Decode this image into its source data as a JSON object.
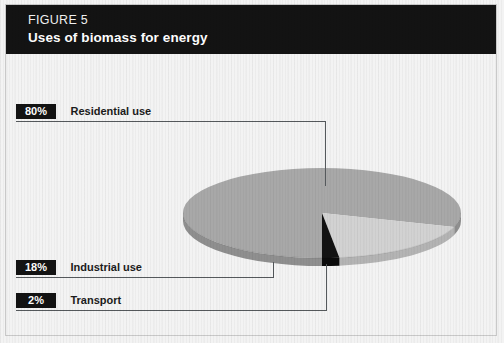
{
  "figure": {
    "number_label": "FIGURE 5",
    "title": "Uses of biomass for energy"
  },
  "callouts": [
    {
      "percent": "80%",
      "label": "Residential use"
    },
    {
      "percent": "18%",
      "label": "Industrial use"
    },
    {
      "percent": "2%",
      "label": "Transport"
    }
  ],
  "colors": {
    "header_background": "#131313",
    "page_background": "#f3f3f3",
    "frame_border": "#c9c9c9",
    "leader_line": "#55595c",
    "slice_residential": "#a8a8a8",
    "slice_residential_side": "#8f8f8f",
    "slice_industrial": "#d2d2d2",
    "slice_industrial_side": "#b4b4b4",
    "slice_transport": "#121212",
    "slice_transport_side": "#0b0b0b",
    "chip_background": "#131313",
    "chip_text": "#ffffff",
    "label_text": "#1b1b1b"
  },
  "chart_data": {
    "type": "pie",
    "title": "Uses of biomass for energy",
    "subtitle": "FIGURE 5",
    "categories": [
      "Residential use",
      "Industrial use",
      "Transport"
    ],
    "values": [
      80,
      18,
      2
    ],
    "value_unit": "%",
    "labels": [
      "80%",
      "18%",
      "2%"
    ],
    "slice_colors": [
      "#a8a8a8",
      "#d2d2d2",
      "#121212"
    ],
    "legend": "callout-labels-left",
    "grid": false,
    "style": "3d-flattened-ellipse",
    "xlabel": "",
    "ylabel": ""
  }
}
